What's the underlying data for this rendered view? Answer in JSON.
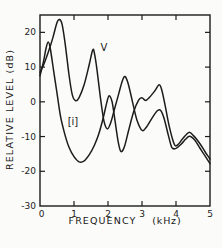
{
  "figure": {
    "y_axis_title": "RELATIVE LEVEL (dB)",
    "x_axis_title_word": "FREQUENCY",
    "x_axis_title_unit": "(kHz)",
    "ink_color": "#1c1c1c",
    "background_color": "#fbfbf9"
  },
  "chart_data": {
    "type": "line",
    "title": "",
    "xlabel": "FREQUENCY (kHz)",
    "ylabel": "RELATIVE LEVEL (dB)",
    "xlim": [
      0,
      5
    ],
    "ylim": [
      -30,
      25
    ],
    "x_tick_labels": [
      0,
      1,
      2,
      3,
      4,
      5
    ],
    "x_tick_marks": [
      1,
      2,
      3,
      4
    ],
    "y_tick_labels": [
      20,
      10,
      0,
      -10,
      -20,
      -30
    ],
    "y_tick_marks": [
      20,
      10,
      0,
      -10,
      -20
    ],
    "grid": false,
    "legend_position": "inline-labels",
    "series": [
      {
        "name": "V",
        "label_x": 1.88,
        "label_y": 15.5,
        "points": [
          [
            0,
            8.5
          ],
          [
            0.12,
            11
          ],
          [
            0.25,
            14.5
          ],
          [
            0.38,
            18.5
          ],
          [
            0.5,
            22.8
          ],
          [
            0.57,
            23.7
          ],
          [
            0.65,
            22.3
          ],
          [
            0.75,
            16
          ],
          [
            0.85,
            8
          ],
          [
            0.95,
            2
          ],
          [
            1.05,
            0.3
          ],
          [
            1.15,
            1.2
          ],
          [
            1.3,
            5
          ],
          [
            1.45,
            10.8
          ],
          [
            1.55,
            14.9
          ],
          [
            1.6,
            14
          ],
          [
            1.68,
            9
          ],
          [
            1.78,
            1
          ],
          [
            1.88,
            -5.5
          ],
          [
            1.98,
            -7.8
          ],
          [
            2.08,
            -6
          ],
          [
            2.18,
            -2.5
          ],
          [
            2.32,
            2.5
          ],
          [
            2.42,
            6
          ],
          [
            2.5,
            7.3
          ],
          [
            2.6,
            5
          ],
          [
            2.72,
            0
          ],
          [
            2.85,
            -5.2
          ],
          [
            3.0,
            -8.2
          ],
          [
            3.12,
            -7.4
          ],
          [
            3.3,
            -4.6
          ],
          [
            3.45,
            -2.6
          ],
          [
            3.55,
            -2.5
          ],
          [
            3.65,
            -4.8
          ],
          [
            3.78,
            -9.8
          ],
          [
            3.88,
            -13.2
          ],
          [
            4.0,
            -13.4
          ],
          [
            4.15,
            -12.2
          ],
          [
            4.28,
            -10.8
          ],
          [
            4.4,
            -9.9
          ],
          [
            4.55,
            -11
          ],
          [
            4.7,
            -13.3
          ],
          [
            4.85,
            -15.5
          ],
          [
            5.0,
            -17.8
          ]
        ]
      },
      {
        "name": "[i]",
        "label_x": 0.97,
        "label_y": -5.8,
        "points": [
          [
            0,
            7.5
          ],
          [
            0.1,
            11.5
          ],
          [
            0.18,
            15.5
          ],
          [
            0.24,
            17.2
          ],
          [
            0.3,
            15.5
          ],
          [
            0.4,
            9
          ],
          [
            0.5,
            2.5
          ],
          [
            0.6,
            -4
          ],
          [
            0.72,
            -9
          ],
          [
            0.85,
            -13
          ],
          [
            1.0,
            -15.8
          ],
          [
            1.15,
            -17.3
          ],
          [
            1.3,
            -17
          ],
          [
            1.45,
            -15.2
          ],
          [
            1.6,
            -12.5
          ],
          [
            1.72,
            -9.5
          ],
          [
            1.85,
            -5
          ],
          [
            1.95,
            -0.8
          ],
          [
            2.03,
            1.7
          ],
          [
            2.12,
            0
          ],
          [
            2.2,
            -5
          ],
          [
            2.3,
            -11.5
          ],
          [
            2.38,
            -14.3
          ],
          [
            2.48,
            -13
          ],
          [
            2.6,
            -8.5
          ],
          [
            2.75,
            -3
          ],
          [
            2.9,
            0.5
          ],
          [
            3.0,
            1.2
          ],
          [
            3.1,
            0.4
          ],
          [
            3.22,
            1.3
          ],
          [
            3.38,
            3.2
          ],
          [
            3.5,
            4.9
          ],
          [
            3.58,
            3.5
          ],
          [
            3.68,
            -1
          ],
          [
            3.8,
            -7
          ],
          [
            3.95,
            -12.2
          ],
          [
            4.05,
            -12.4
          ],
          [
            4.2,
            -10.6
          ],
          [
            4.38,
            -8.8
          ],
          [
            4.52,
            -9.8
          ],
          [
            4.7,
            -12
          ],
          [
            4.85,
            -14.3
          ],
          [
            5.0,
            -16.5
          ]
        ]
      }
    ]
  }
}
